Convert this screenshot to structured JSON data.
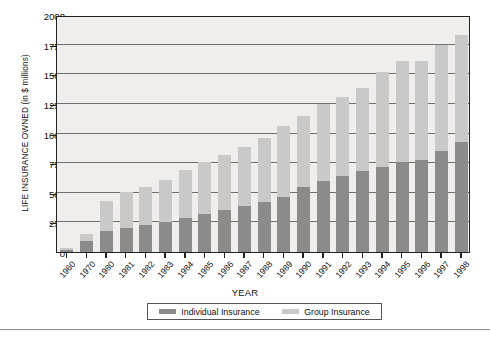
{
  "chart_data": {
    "type": "bar",
    "stacked": true,
    "title": "",
    "xlabel": "YEAR",
    "ylabel": "LIFE INSURANCE OWNED (in $ millions)",
    "ylim": [
      0,
      2000
    ],
    "yticks": [
      0,
      250,
      500,
      750,
      1000,
      1250,
      1500,
      1750,
      2000
    ],
    "ytick_labels": [
      "0",
      "250",
      "500",
      "750",
      "1000",
      "1250",
      "1500",
      "1750",
      "2000"
    ],
    "grid": true,
    "grid_axis": "y",
    "legend_position": "bottom",
    "categories": [
      "1960",
      "1970",
      "1980",
      "1981",
      "1982",
      "1983",
      "1984",
      "1985",
      "1986",
      "1987",
      "1988",
      "1989",
      "1990",
      "1991",
      "1992",
      "1993",
      "1994",
      "1995",
      "1996",
      "1997",
      "1998"
    ],
    "series": [
      {
        "name": "Individual Insurance",
        "color": "#8b8b8b",
        "values": [
          20,
          90,
          175,
          200,
          230,
          255,
          290,
          320,
          355,
          390,
          420,
          465,
          545,
          600,
          645,
          680,
          715,
          760,
          780,
          850,
          930
        ]
      },
      {
        "name": "Group Insurance",
        "color": "#c9c9c9",
        "values": [
          15,
          60,
          255,
          305,
          320,
          350,
          400,
          440,
          465,
          500,
          545,
          595,
          605,
          645,
          660,
          700,
          805,
          850,
          830,
          900,
          900
        ]
      }
    ],
    "totals": [
      35,
      150,
      430,
      505,
      550,
      605,
      690,
      760,
      820,
      890,
      965,
      1060,
      1150,
      1245,
      1305,
      1380,
      1520,
      1610,
      1610,
      1750,
      1830
    ]
  },
  "legend": {
    "entries": [
      {
        "label": "Individual Insurance",
        "color": "#8b8b8b"
      },
      {
        "label": "Group Insurance",
        "color": "#c9c9c9"
      }
    ]
  },
  "axis": {
    "x_title": "YEAR",
    "y_title": "LIFE INSURANCE OWNED (in $ millions)"
  }
}
